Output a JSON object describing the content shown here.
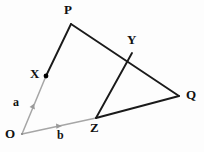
{
  "figure": {
    "background_color": "#fdfdfd",
    "width": 204,
    "height": 152,
    "line_colors": {
      "solid_black": "#1a1a1a",
      "vector_gray": "#a6a6a6",
      "point_dot": "#000000"
    }
  },
  "points": {
    "O": {
      "label": "O",
      "x": 22,
      "y": 134,
      "label_x": 6,
      "label_y": 128
    },
    "P": {
      "label": "P",
      "x": 71,
      "y": 24,
      "label_x": 64,
      "label_y": 4
    },
    "Q": {
      "label": "Q",
      "x": 179,
      "y": 96,
      "label_x": 186,
      "label_y": 89
    },
    "X": {
      "label": "X",
      "x": 46,
      "y": 76,
      "label_x": 30,
      "label_y": 68
    },
    "Y": {
      "label": "Y",
      "x": 132,
      "y": 53,
      "label_x": 127,
      "label_y": 34
    },
    "Z": {
      "label": "Z",
      "x": 96,
      "y": 118,
      "label_x": 91,
      "label_y": 122
    }
  },
  "vectors": {
    "a": {
      "label": "a",
      "label_x": 13,
      "label_y": 97,
      "from": "O",
      "to": "X",
      "color": "#a6a6a6"
    },
    "b": {
      "label": "b",
      "label_x": 57,
      "label_y": 130,
      "from": "O",
      "to": "Z",
      "color": "#a6a6a6"
    }
  },
  "segments": [
    {
      "name": "O-to-P",
      "from": "O",
      "to": "P",
      "style": "gray-then-black",
      "color": "#a6a6a6"
    },
    {
      "name": "X-to-P",
      "from": "X",
      "to": "P",
      "style": "solid",
      "color": "#1a1a1a"
    },
    {
      "name": "P-to-Q",
      "from": "P",
      "to": "Q",
      "style": "solid",
      "color": "#1a1a1a"
    },
    {
      "name": "O-to-Z",
      "from": "O",
      "to": "Z",
      "style": "solid",
      "color": "#a6a6a6"
    },
    {
      "name": "Z-to-Q",
      "from": "Z",
      "to": "Q",
      "style": "solid",
      "color": "#1a1a1a"
    },
    {
      "name": "Z-to-Y",
      "from": "Z",
      "to": "Y",
      "style": "solid",
      "color": "#1a1a1a"
    }
  ],
  "markers": {
    "x_dot": {
      "name": "point-marker-X",
      "x": 46,
      "y": 76,
      "r": 2.3,
      "color": "#000000"
    },
    "a_arrow": {
      "name": "vector-arrow-a",
      "x": 33,
      "y": 106,
      "color": "#9a9a9a"
    },
    "b_arrow": {
      "name": "vector-arrow-b",
      "x": 59,
      "y": 126,
      "color": "#9a9a9a"
    }
  }
}
